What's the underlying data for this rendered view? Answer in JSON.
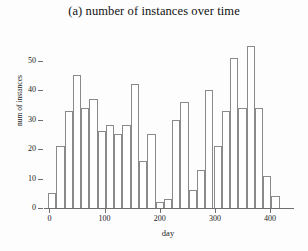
{
  "chart_data": {
    "type": "bar",
    "title": "(a) number of instances over time",
    "xlabel": "day",
    "ylabel": "num of instances",
    "xlim": [
      -8,
      438
    ],
    "ylim": [
      0,
      57
    ],
    "grid": false,
    "legend": null,
    "bar_width_days": 15,
    "xticks": [
      0,
      100,
      200,
      300,
      400
    ],
    "yticks": [
      0,
      10,
      20,
      30,
      40,
      50
    ],
    "bar_edge_color": "#8a8a8a",
    "bar_face_color": "#ffffff",
    "axis_color": "#6e6e6e",
    "x": [
      5,
      20,
      35,
      50,
      65,
      80,
      95,
      110,
      125,
      140,
      155,
      170,
      185,
      200,
      215,
      230,
      245,
      260,
      275,
      290,
      305,
      320,
      335,
      350,
      365,
      380,
      395,
      410,
      425
    ],
    "categories": [
      "5",
      "20",
      "35",
      "50",
      "65",
      "80",
      "95",
      "110",
      "125",
      "140",
      "155",
      "170",
      "185",
      "200",
      "215",
      "230",
      "245",
      "260",
      "275",
      "290",
      "305",
      "320",
      "335",
      "350",
      "365",
      "380",
      "395",
      "410",
      "425"
    ],
    "values": [
      5,
      21,
      33,
      45,
      34,
      37,
      26,
      28,
      25,
      28,
      42,
      16,
      25,
      2,
      3,
      30,
      36,
      6,
      13,
      40,
      21,
      33,
      51,
      34,
      55,
      34,
      11,
      4,
      0
    ]
  },
  "axes": {
    "ytick_labels": [
      "0",
      "10",
      "20",
      "30",
      "40",
      "50"
    ],
    "xtick_labels": [
      "0",
      "100",
      "200",
      "300",
      "400"
    ]
  }
}
